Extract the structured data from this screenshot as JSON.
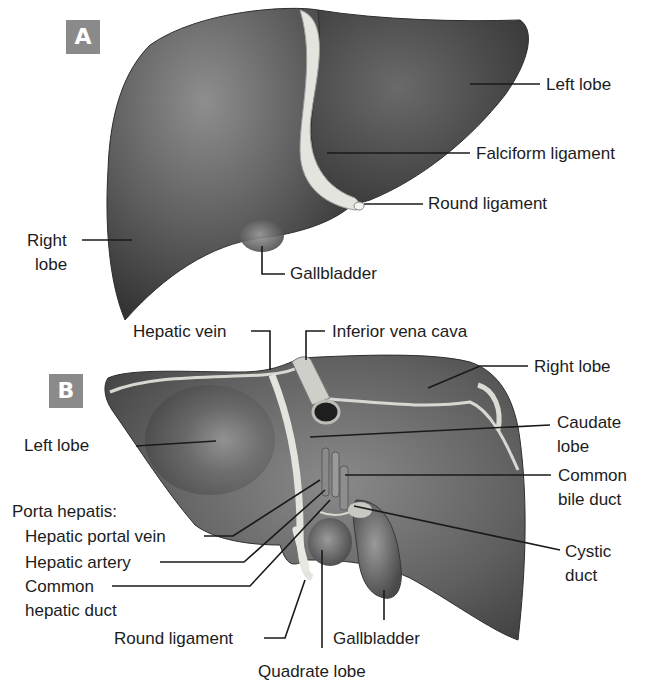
{
  "colors": {
    "liver_dark": "#3c3c3c",
    "liver_mid": "#6e6e6e",
    "liver_light": "#a8a8a8",
    "ligament": "#e6e6e0",
    "badge_bg": "#8a8a8a",
    "leader_line": "#1a1a1a"
  },
  "panel_a": {
    "badge": "A",
    "view": "anterior",
    "labels": {
      "left_lobe": "Left lobe",
      "falciform_ligament": "Falciform ligament",
      "round_ligament": "Round ligament",
      "right_lobe_line1": "Right",
      "right_lobe_line2": "lobe",
      "gallbladder": "Gallbladder"
    }
  },
  "panel_b": {
    "badge": "B",
    "view": "posteroinferior",
    "labels": {
      "hepatic_vein": "Hepatic vein",
      "inferior_vena_cava": "Inferior vena cava",
      "right_lobe": "Right lobe",
      "left_lobe": "Left lobe",
      "caudate_lobe_line1": "Caudate",
      "caudate_lobe_line2": "lobe",
      "common_bile_duct_line1": "Common",
      "common_bile_duct_line2": "bile duct",
      "porta_hepatis_heading": "Porta hepatis:",
      "hepatic_portal_vein": "Hepatic portal vein",
      "hepatic_artery": "Hepatic artery",
      "common_hepatic_duct_line1": "Common",
      "common_hepatic_duct_line2": "hepatic duct",
      "cystic_duct_line1": "Cystic",
      "cystic_duct_line2": "duct",
      "round_ligament": "Round ligament",
      "gallbladder": "Gallbladder",
      "quadrate_lobe": "Quadrate lobe"
    }
  }
}
